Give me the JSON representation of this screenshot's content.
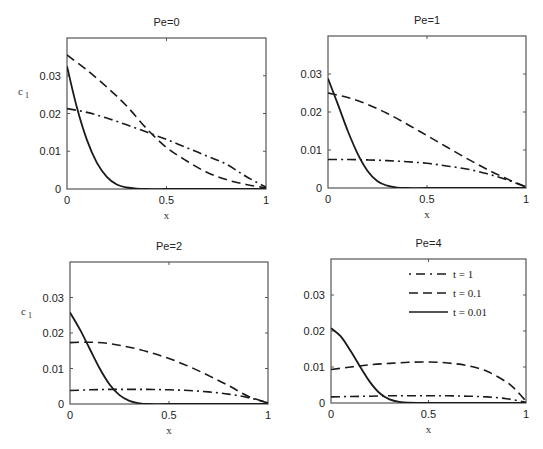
{
  "chart_data": [
    {
      "type": "line",
      "title": "Pe=0",
      "xlabel": "x",
      "ylabel": "c 1",
      "xlim": [
        0,
        1
      ],
      "ylim": [
        0,
        0.04
      ],
      "xticks": [
        "0",
        "0.5",
        "1"
      ],
      "yticks": [
        "0",
        "0.01",
        "0.02",
        "0.03"
      ],
      "grid": false,
      "box": {
        "left": 67,
        "top": 38,
        "right": 266,
        "bottom": 189
      },
      "series": [
        {
          "name": "t = 1",
          "style": "dashdot",
          "x": [
            0,
            0.1,
            0.2,
            0.3,
            0.4,
            0.5,
            0.6,
            0.7,
            0.8,
            0.9,
            1.0
          ],
          "values": [
            0.0213,
            0.0203,
            0.0188,
            0.017,
            0.0151,
            0.0131,
            0.011,
            0.0088,
            0.0066,
            0.0033,
            0.0005
          ]
        },
        {
          "name": "t = 0.1",
          "style": "dashed",
          "x": [
            0,
            0.1,
            0.2,
            0.3,
            0.4,
            0.5,
            0.6,
            0.7,
            0.8,
            0.9,
            1.0
          ],
          "values": [
            0.0355,
            0.0315,
            0.027,
            0.022,
            0.016,
            0.011,
            0.0075,
            0.0045,
            0.0025,
            0.0012,
            0.0003
          ]
        },
        {
          "name": "t = 0.01",
          "style": "solid",
          "x": [
            0,
            0.05,
            0.1,
            0.15,
            0.2,
            0.25,
            0.3,
            0.35,
            0.4,
            0.5,
            0.7,
            1.0
          ],
          "values": [
            0.0325,
            0.0215,
            0.013,
            0.007,
            0.0032,
            0.0012,
            0.0004,
            0.0001,
            0,
            0,
            0,
            0
          ]
        }
      ]
    },
    {
      "type": "line",
      "title": "Pe=1",
      "xlabel": "x",
      "ylabel": "",
      "xlim": [
        0,
        1
      ],
      "ylim": [
        0,
        0.04
      ],
      "xticks": [
        "0",
        "0.5",
        "1"
      ],
      "yticks": [
        "0",
        "0.01",
        "0.02",
        "0.03"
      ],
      "grid": false,
      "box": {
        "left": 328,
        "top": 36,
        "right": 526,
        "bottom": 188
      },
      "series": [
        {
          "name": "t = 1",
          "style": "dashdot",
          "x": [
            0,
            0.1,
            0.2,
            0.3,
            0.4,
            0.5,
            0.6,
            0.7,
            0.8,
            0.9,
            1.0
          ],
          "values": [
            0.0075,
            0.0075,
            0.0074,
            0.0072,
            0.0069,
            0.0065,
            0.0058,
            0.005,
            0.0038,
            0.0022,
            0.0003
          ]
        },
        {
          "name": "t = 0.1",
          "style": "dashed",
          "x": [
            0,
            0.1,
            0.2,
            0.3,
            0.4,
            0.5,
            0.6,
            0.7,
            0.8,
            0.9,
            1.0
          ],
          "values": [
            0.025,
            0.0238,
            0.022,
            0.0196,
            0.0168,
            0.0138,
            0.0108,
            0.0078,
            0.005,
            0.0025,
            0.0003
          ]
        },
        {
          "name": "t = 0.01",
          "style": "solid",
          "x": [
            0,
            0.05,
            0.1,
            0.15,
            0.2,
            0.25,
            0.3,
            0.35,
            0.4,
            0.5,
            0.7,
            1.0
          ],
          "values": [
            0.0288,
            0.022,
            0.015,
            0.009,
            0.0045,
            0.0018,
            0.0006,
            0.0001,
            0,
            0,
            0,
            0
          ]
        }
      ]
    },
    {
      "type": "line",
      "title": "Pe=2",
      "xlabel": "x",
      "ylabel": "c 1",
      "xlim": [
        0,
        1
      ],
      "ylim": [
        0,
        0.04
      ],
      "xticks": [
        "0",
        "0.5",
        "1"
      ],
      "yticks": [
        "0",
        "0.01",
        "0.02",
        "0.03"
      ],
      "grid": false,
      "box": {
        "left": 70,
        "top": 262,
        "right": 268,
        "bottom": 404
      },
      "series": [
        {
          "name": "t = 1",
          "style": "dashdot",
          "x": [
            0,
            0.1,
            0.2,
            0.3,
            0.4,
            0.5,
            0.6,
            0.7,
            0.8,
            0.9,
            1.0
          ],
          "values": [
            0.0038,
            0.004,
            0.0041,
            0.0041,
            0.0041,
            0.004,
            0.0038,
            0.0034,
            0.0028,
            0.0018,
            0.0003
          ]
        },
        {
          "name": "t = 0.1",
          "style": "dashed",
          "x": [
            0,
            0.1,
            0.2,
            0.3,
            0.4,
            0.5,
            0.6,
            0.7,
            0.8,
            0.9,
            1.0
          ],
          "values": [
            0.0173,
            0.0174,
            0.017,
            0.016,
            0.0146,
            0.0128,
            0.0106,
            0.008,
            0.0052,
            0.0022,
            0.0003
          ]
        },
        {
          "name": "t = 0.01",
          "style": "solid",
          "x": [
            0,
            0.05,
            0.1,
            0.15,
            0.2,
            0.25,
            0.3,
            0.35,
            0.4,
            0.5,
            0.7,
            1.0
          ],
          "values": [
            0.0258,
            0.021,
            0.0155,
            0.01,
            0.0055,
            0.0025,
            0.0009,
            0.0002,
            0,
            0,
            0,
            0
          ]
        }
      ]
    },
    {
      "type": "line",
      "title": "Pe=4",
      "xlabel": "x",
      "ylabel": "",
      "xlim": [
        0,
        1
      ],
      "ylim": [
        0,
        0.04
      ],
      "xticks": [
        "0",
        "0.5",
        "1"
      ],
      "yticks": [
        "0",
        "0.01",
        "0.02",
        "0.03"
      ],
      "grid": false,
      "legend_position": "upper right",
      "box": {
        "left": 331,
        "top": 259,
        "right": 526,
        "bottom": 403
      },
      "series": [
        {
          "name": "t = 1",
          "style": "dashdot",
          "x": [
            0,
            0.1,
            0.2,
            0.3,
            0.4,
            0.5,
            0.6,
            0.7,
            0.8,
            0.9,
            1.0
          ],
          "values": [
            0.0017,
            0.0018,
            0.0019,
            0.002,
            0.002,
            0.002,
            0.002,
            0.0019,
            0.0017,
            0.0012,
            0.0002
          ]
        },
        {
          "name": "t = 0.1",
          "style": "dashed",
          "x": [
            0,
            0.1,
            0.2,
            0.3,
            0.4,
            0.5,
            0.6,
            0.7,
            0.8,
            0.9,
            0.95,
            1.0
          ],
          "values": [
            0.0093,
            0.01,
            0.0106,
            0.011,
            0.0113,
            0.0114,
            0.0111,
            0.0104,
            0.0088,
            0.0058,
            0.0035,
            0.0005
          ]
        },
        {
          "name": "t = 0.01",
          "style": "solid",
          "x": [
            0,
            0.05,
            0.1,
            0.15,
            0.2,
            0.25,
            0.3,
            0.35,
            0.4,
            0.5,
            0.7,
            1.0
          ],
          "values": [
            0.0208,
            0.0185,
            0.0145,
            0.01,
            0.0058,
            0.0027,
            0.001,
            0.0003,
            0.0001,
            0,
            0,
            0
          ]
        }
      ]
    }
  ],
  "legend": {
    "entries": [
      {
        "label": "t = 1",
        "style": "dashdot"
      },
      {
        "label": "t = 0.1",
        "style": "dashed"
      },
      {
        "label": "t = 0.01",
        "style": "solid"
      }
    ]
  },
  "colors": {
    "line": "#1a1a1a",
    "axis": "#555555"
  }
}
